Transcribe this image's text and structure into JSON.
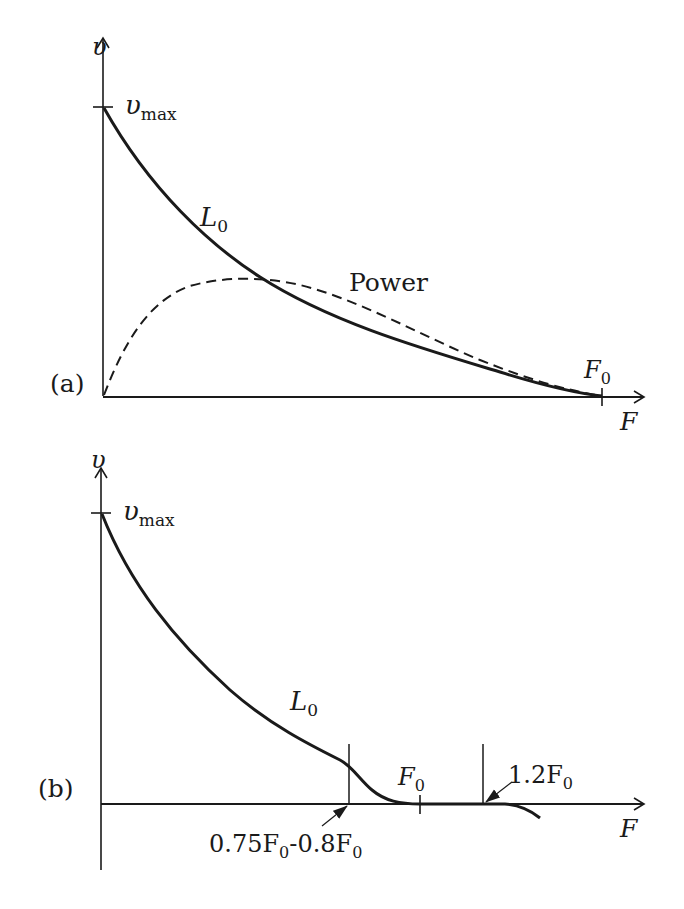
{
  "figure": {
    "panel_a": {
      "label": "(a)",
      "y_axis_label": "υ",
      "y_tick_label_main": "υ",
      "y_tick_label_sub": "max",
      "x_axis_label": "F",
      "x_tick_label_main": "F",
      "x_tick_label_sub": "0",
      "curve_label_main": "L",
      "curve_label_sub": "0",
      "power_label": "Power"
    },
    "panel_b": {
      "label": "(b)",
      "y_axis_label": "υ",
      "y_tick_label_main": "υ",
      "y_tick_label_sub": "max",
      "x_axis_label": "F",
      "x_tick_label_main": "F",
      "x_tick_label_sub": "0",
      "curve_label_main": "L",
      "curve_label_sub": "0",
      "annotation_low": {
        "p1": "0.75F",
        "s1": "0",
        "p2": "-0.8F",
        "s2": "0"
      },
      "annotation_high": {
        "p1": "1.2F",
        "s1": "0"
      }
    }
  },
  "colors": {
    "ink": "#1a1a1a",
    "paper": "#ffffff"
  }
}
